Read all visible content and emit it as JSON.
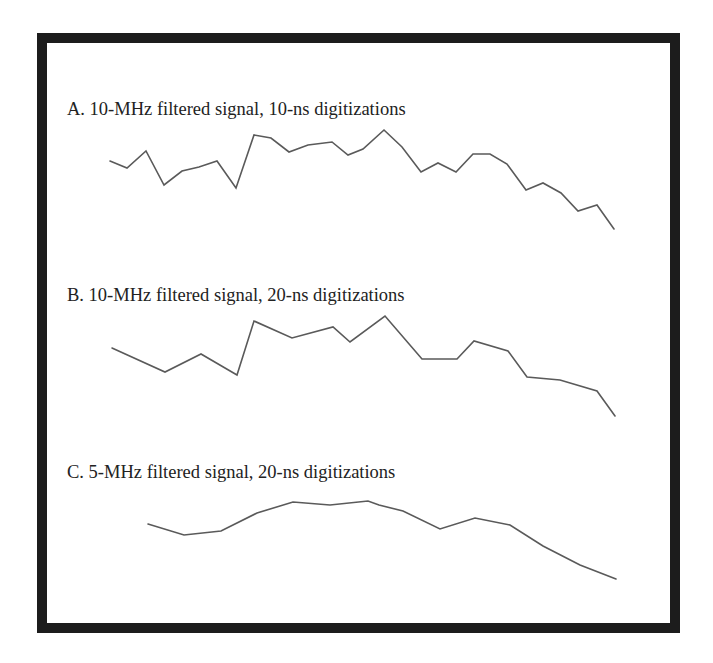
{
  "figure": {
    "panels": [
      {
        "id": "A",
        "label": "A. 10-MHz filtered signal, 10-ns digitizations"
      },
      {
        "id": "B",
        "label": "B. 10-MHz filtered signal, 20-ns digitizations"
      },
      {
        "id": "C",
        "label": "C. 5-MHz filtered signal, 20-ns digitizations"
      }
    ],
    "colors": {
      "frame": "#1c1c1c",
      "trace": "#5a5a5a",
      "text": "#222222",
      "background": "#ffffff"
    }
  },
  "chart_data": [
    {
      "type": "line",
      "title": "A. 10-MHz filtered signal, 10-ns digitizations",
      "xlabel": "",
      "ylabel": "",
      "grid": false,
      "axes_visible": false,
      "note": "Values are relative signal amplitude read from pixel positions (higher = larger), arbitrary units 0-100",
      "x": [
        0,
        1,
        2,
        3,
        4,
        5,
        6,
        7,
        8,
        9,
        10,
        11,
        12,
        13,
        14,
        15,
        16,
        17,
        18,
        19,
        20,
        21,
        22,
        23,
        24,
        25,
        26,
        27,
        28,
        29
      ],
      "series": [
        {
          "name": "A",
          "points_px": [
            [
              110,
              161
            ],
            [
              127,
              168
            ],
            [
              146,
              151
            ],
            [
              164,
              185
            ],
            [
              182,
              171
            ],
            [
              199,
              167
            ],
            [
              217,
              161
            ],
            [
              236,
              188
            ],
            [
              254,
              135
            ],
            [
              271,
              138
            ],
            [
              289,
              152
            ],
            [
              308,
              145
            ],
            [
              332,
              142
            ],
            [
              348,
              155
            ],
            [
              363,
              149
            ],
            [
              384,
              130
            ],
            [
              402,
              147
            ],
            [
              421,
              172
            ],
            [
              438,
              163
            ],
            [
              456,
              172
            ],
            [
              473,
              154
            ],
            [
              490,
              154
            ],
            [
              507,
              164
            ],
            [
              526,
              190
            ],
            [
              543,
              183
            ],
            [
              561,
              193
            ],
            [
              578,
              211
            ],
            [
              597,
              205
            ],
            [
              614,
              229
            ]
          ],
          "values": [
            68,
            61,
            78,
            44,
            58,
            62,
            68,
            41,
            94,
            91,
            77,
            84,
            87,
            74,
            80,
            99,
            82,
            57,
            66,
            57,
            75,
            75,
            65,
            39,
            46,
            36,
            18,
            24,
            0
          ]
        }
      ]
    },
    {
      "type": "line",
      "title": "B. 10-MHz filtered signal, 20-ns digitizations",
      "xlabel": "",
      "ylabel": "",
      "grid": false,
      "axes_visible": false,
      "note": "Values are relative signal amplitude read from pixel positions (higher = larger), arbitrary units 0-100",
      "series": [
        {
          "name": "B",
          "points_px": [
            [
              112,
              348
            ],
            [
              165,
              372
            ],
            [
              201,
              354
            ],
            [
              237,
              375
            ],
            [
              254,
              321
            ],
            [
              292,
              338
            ],
            [
              333,
              327
            ],
            [
              350,
              342
            ],
            [
              385,
              316
            ],
            [
              422,
              359
            ],
            [
              457,
              359
            ],
            [
              474,
              341
            ],
            [
              508,
              351
            ],
            [
              527,
              377
            ],
            [
              560,
              380
            ],
            [
              597,
              391
            ],
            [
              615,
              416
            ]
          ],
          "values": [
            68,
            44,
            62,
            41,
            95,
            78,
            89,
            74,
            100,
            57,
            57,
            75,
            65,
            39,
            36,
            25,
            0
          ]
        }
      ]
    },
    {
      "type": "line",
      "title": "C. 5-MHz filtered signal, 20-ns digitizations",
      "xlabel": "",
      "ylabel": "",
      "grid": false,
      "axes_visible": false,
      "note": "Values are relative signal amplitude read from pixel positions (higher = larger), arbitrary units 0-100",
      "series": [
        {
          "name": "C",
          "points_px": [
            [
              148,
              524
            ],
            [
              184,
              535
            ],
            [
              221,
              531
            ],
            [
              257,
              513
            ],
            [
              293,
              502
            ],
            [
              330,
              505
            ],
            [
              368,
              501
            ],
            [
              379,
              505
            ],
            [
              403,
              511
            ],
            [
              440,
              529
            ],
            [
              475,
              518
            ],
            [
              510,
              525
            ],
            [
              543,
              546
            ],
            [
              580,
              565
            ],
            [
              616,
              579
            ]
          ],
          "values": [
            71,
            56,
            62,
            85,
            99,
            95,
            100,
            95,
            87,
            64,
            78,
            69,
            42,
            18,
            0
          ]
        }
      ]
    }
  ]
}
